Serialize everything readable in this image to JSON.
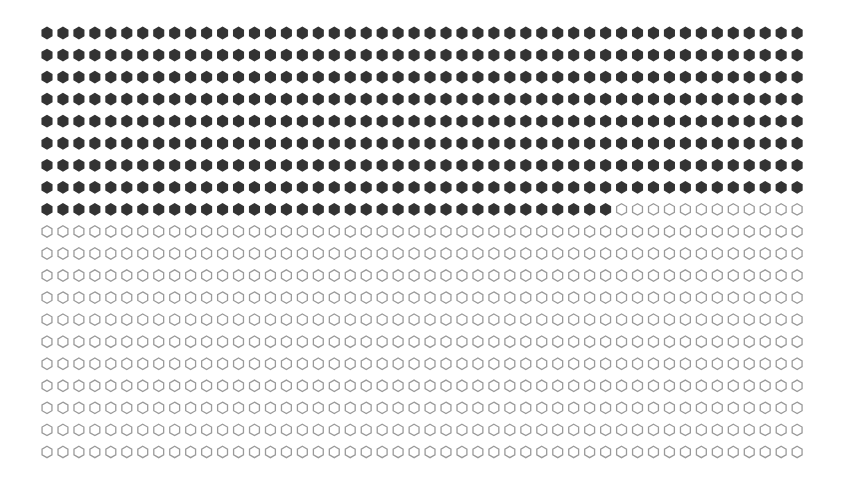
{
  "chart_data": {
    "type": "waffle",
    "title": "",
    "xlabel": "",
    "ylabel": "",
    "rows": 20,
    "columns": 48,
    "total": 960,
    "filled": 420,
    "empty": 540,
    "fill_order": "row-major, left-to-right, top-to-bottom",
    "marker": "hexagon (pointy-top)",
    "series": [
      {
        "name": "filled",
        "value": 420,
        "color": "#333333",
        "style": "solid"
      },
      {
        "name": "empty",
        "value": 540,
        "color": "#9a9a9a",
        "style": "outline"
      }
    ],
    "legend": [],
    "grid": false
  },
  "layout": {
    "origin_x": 47,
    "origin_y": 33,
    "pitch_x": 15.96,
    "pitch_y": 22.05,
    "hex_radius": 6.4
  }
}
